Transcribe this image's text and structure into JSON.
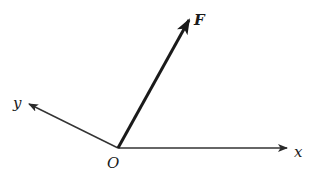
{
  "diagram": {
    "type": "vector-coordinate-diagram",
    "origin": {
      "label": "O",
      "x": 118,
      "y": 148
    },
    "axes": [
      {
        "name": "x",
        "label": "x",
        "end": {
          "x": 287,
          "y": 148
        },
        "label_pos": {
          "x": 294,
          "y": 157
        }
      },
      {
        "name": "y",
        "label": "y",
        "end": {
          "x": 29,
          "y": 104
        },
        "label_pos": {
          "x": 13,
          "y": 108
        }
      }
    ],
    "vector": {
      "name": "F",
      "label": "F",
      "end": {
        "x": 189,
        "y": 20
      },
      "label_pos": {
        "x": 194,
        "y": 25
      }
    },
    "colors": {
      "stroke": "#2a2a2a",
      "background": "#ffffff"
    }
  }
}
